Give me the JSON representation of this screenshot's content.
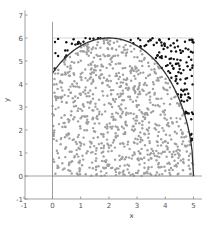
{
  "chart_data": {
    "type": "scatter",
    "title": "",
    "xlabel": "x",
    "ylabel": "y",
    "xlim": [
      -1,
      5.3
    ],
    "ylim": [
      -1,
      7.2
    ],
    "xticks": [
      -1,
      0,
      1,
      2,
      3,
      4,
      5
    ],
    "yticks": [
      -1,
      0,
      1,
      2,
      3,
      4,
      5,
      6,
      7
    ],
    "grid": false,
    "legend": null,
    "sampling_region": {
      "x": [
        0,
        5
      ],
      "y": [
        0,
        6
      ]
    },
    "curve": {
      "type": "ellipse-arc",
      "center": [
        2,
        0
      ],
      "rx": 3,
      "ry": 6,
      "x_range": [
        0,
        5
      ]
    },
    "series": [
      {
        "name": "inside",
        "color": "#a0a0a0",
        "marker_size": 2.4,
        "approx_count": 900
      },
      {
        "name": "outside",
        "color": "#111111",
        "marker_size": 2.4,
        "approx_count": 150
      }
    ],
    "total_points": 1050,
    "reference_lines": [
      {
        "axis": "x",
        "value": 0
      },
      {
        "axis": "y",
        "value": 0
      }
    ]
  },
  "colors": {
    "inside": "#a0a0a0",
    "outside": "#111111",
    "curve": "#333333",
    "axis": "#888888",
    "region_border": "#bbbbbb"
  }
}
